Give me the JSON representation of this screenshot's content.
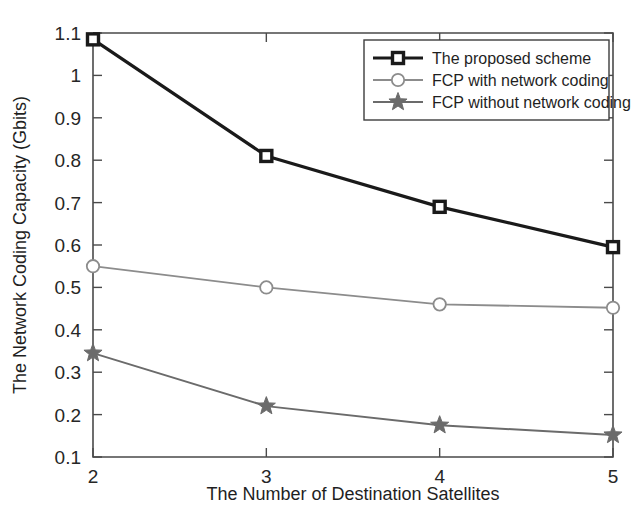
{
  "chart_data": {
    "type": "line",
    "title": "",
    "xlabel": "The Number of Destination Satellites",
    "ylabel": "The Network Coding Capacity (Gbits)",
    "x": [
      2,
      3,
      4,
      5
    ],
    "xticklabels": [
      "2",
      "3",
      "4",
      "5"
    ],
    "yticklabels": [
      "0.1",
      "0.2",
      "0.3",
      "0.4",
      "0.5",
      "0.6",
      "0.7",
      "0.8",
      "0.9",
      "1",
      "1.1"
    ],
    "yticks": [
      0.1,
      0.2,
      0.3,
      0.4,
      0.5,
      0.6,
      0.7,
      0.8,
      0.9,
      1.0,
      1.1
    ],
    "xlim": [
      2,
      5
    ],
    "ylim": [
      0.1,
      1.1
    ],
    "grid": false,
    "legend_position": "upper right",
    "series": [
      {
        "name": "The proposed scheme",
        "values": [
          1.085,
          0.81,
          0.69,
          0.595
        ],
        "color": "#1a1a1a",
        "marker": "square",
        "linewidth": 3.2
      },
      {
        "name": "FCP with network coding",
        "values": [
          0.55,
          0.5,
          0.46,
          0.452
        ],
        "color": "#8c8c8c",
        "marker": "circle",
        "linewidth": 1.8
      },
      {
        "name": "FCP without network coding",
        "values": [
          0.345,
          0.22,
          0.175,
          0.152
        ],
        "color": "#6b6b6b",
        "marker": "star",
        "linewidth": 2.0
      }
    ]
  },
  "legend": {
    "entries": [
      {
        "label": "The proposed scheme"
      },
      {
        "label": "FCP with network coding"
      },
      {
        "label": "FCP without network coding"
      }
    ]
  }
}
